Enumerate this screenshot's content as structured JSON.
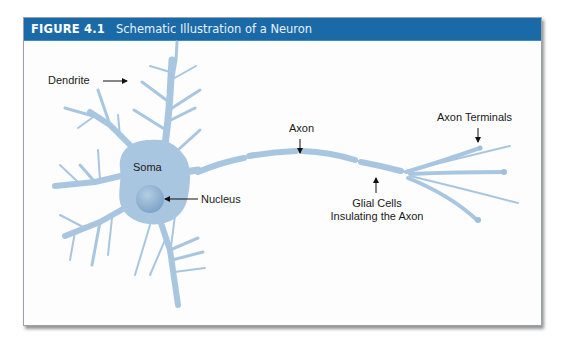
{
  "figure": {
    "number": "FIGURE 4.1",
    "title": "Schematic Illustration of a Neuron"
  },
  "labels": {
    "dendrite": "Dendrite",
    "soma": "Soma",
    "nucleus": "Nucleus",
    "axon": "Axon",
    "glial_line1": "Glial Cells",
    "glial_line2": "Insulating the Axon",
    "axon_terminals": "Axon Terminals"
  },
  "colors": {
    "header_bg": "#1b6aa8",
    "neuron_fill": "#a9c6e0",
    "nucleus_fill": "#8fb2d4"
  }
}
